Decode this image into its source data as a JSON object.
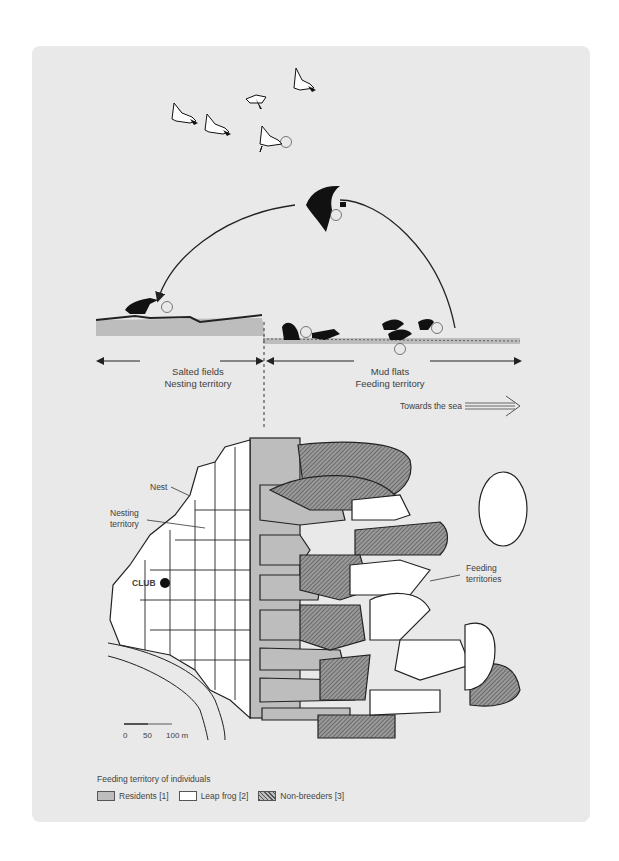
{
  "figure": {
    "top_section": {
      "flock_label": "3",
      "flying_bird_label": "2",
      "nesting_bird_label": "2",
      "feeding_labels": [
        "1",
        "3",
        "2"
      ],
      "left_zone": {
        "line1": "Salted fields",
        "line2": "Nesting territory"
      },
      "right_zone": {
        "line1": "Mud flats",
        "line2": "Feeding territory"
      },
      "direction_label": "Towards the sea"
    },
    "map": {
      "labels": {
        "nest": "Nest",
        "nesting_territory_line1": "Nesting",
        "nesting_territory_line2": "territory",
        "club": "CLUB",
        "feeding_territories_line1": "Feeding",
        "feeding_territories_line2": "territories"
      },
      "scale": {
        "ticks": [
          "0",
          "50",
          "100 m"
        ]
      }
    },
    "legend": {
      "title": "Feeding territory of individuals",
      "items": [
        {
          "label": "Residents [1]",
          "color": "#bdbdbd",
          "pattern": "solid"
        },
        {
          "label": "Leap frog [2]",
          "color": "#ffffff",
          "pattern": "solid"
        },
        {
          "label": "Non-breeders [3]",
          "color": "#7a7a7a",
          "pattern": "hatched"
        }
      ]
    },
    "colors": {
      "card_background": "#e9e9e9",
      "residents_fill": "#bdbdbd",
      "leap_frog_fill": "#ffffff",
      "line": "#222222"
    }
  }
}
